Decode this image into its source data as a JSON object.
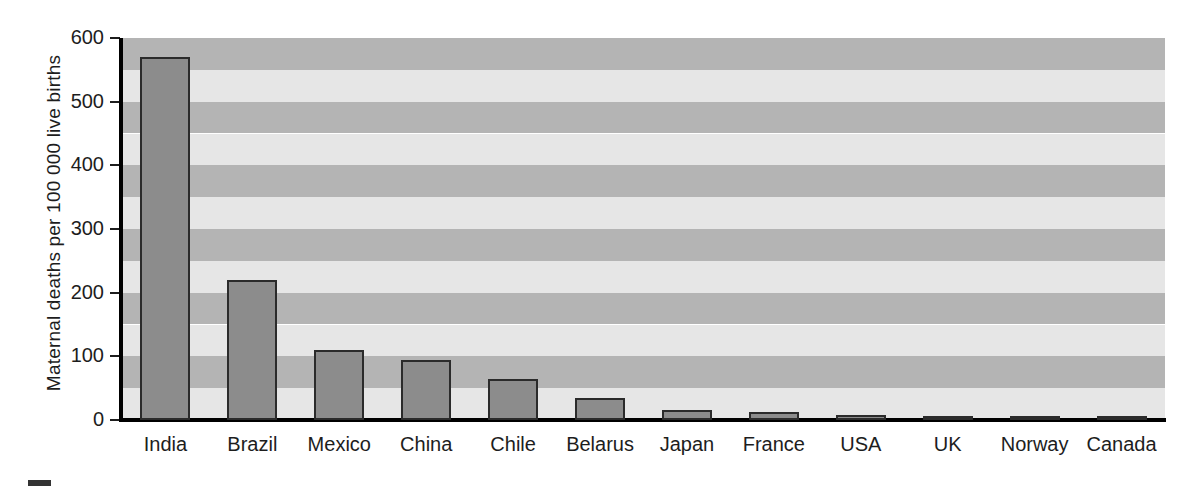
{
  "chart_data": {
    "type": "bar",
    "title": "",
    "subtitle": "",
    "xlabel": "",
    "ylabel": "Maternal deaths per 100 000 live births",
    "categories": [
      "India",
      "Brazil",
      "Mexico",
      "China",
      "Chile",
      "Belarus",
      "Japan",
      "France",
      "USA",
      "UK",
      "Norway",
      "Canada"
    ],
    "values": [
      570,
      220,
      110,
      95,
      65,
      35,
      15,
      13,
      8,
      6,
      4,
      4
    ],
    "ylim": [
      0,
      600
    ],
    "yticks": [
      0,
      100,
      200,
      300,
      400,
      500,
      600
    ],
    "ytick_labels": [
      "0",
      "100",
      "200",
      "300",
      "400",
      "500",
      "600"
    ],
    "grid": false,
    "banded_background": true,
    "band_interval": 50,
    "legend": null,
    "annotations": []
  },
  "style": {
    "bar_fill": "#8c8c8c",
    "bar_edge": "#2b2b2b",
    "band_dark": "#b4b4b4",
    "band_light": "#e6e6e6",
    "axis_color": "#000000",
    "text_color": "#1d1d1d",
    "page_background": "#ffffff",
    "footer_marker_color": "#333333"
  },
  "footer": {
    "marker_name": "page-rule-marker"
  }
}
